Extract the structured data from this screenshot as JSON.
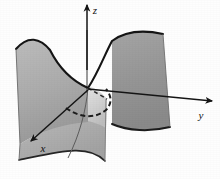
{
  "figure": {
    "kind": "3d-surface-plot",
    "title": "",
    "background_color": "#fefefe",
    "surface_name": "hyperbolic paraboloid saddle surface",
    "ink_color": "#151515"
  },
  "axes": {
    "origin": {
      "x": 87,
      "y": 88
    },
    "z": {
      "label": "z",
      "label_x": 95,
      "label_y": 12,
      "tip_x": 87,
      "tip_y": 5,
      "tail_x": 87,
      "tail_y": 93,
      "direction": "up"
    },
    "y": {
      "label": "y",
      "label_x": 201,
      "label_y": 117,
      "tip_x": 212,
      "tip_y": 101,
      "tail_x": 88,
      "tail_y": 89,
      "direction": "right-down"
    },
    "x": {
      "label": "x",
      "label_x": 43,
      "label_y": 150,
      "tip_x": 31,
      "tip_y": 141,
      "tail_x": 88,
      "tail_y": 90,
      "direction": "down-left"
    }
  },
  "surface": {
    "lobes": [
      {
        "name": "left-back-lobe",
        "fill_top": "#b3b3b3",
        "fill_bottom": "#9b9b9b",
        "path": "M 16 49 L 20 144 C 40 131 62 126 88 124 L 88 88 C 70 80 58 66 50 50 C 40 38 28 35 16 49 Z"
      },
      {
        "name": "right-back-lobe",
        "fill_top": "#9d9d9d",
        "fill_bottom": "#8a8a8a",
        "path": "M 112 41 C 124 32 140 29 163 34 L 170 127 C 150 132 128 131 112 124 Z"
      },
      {
        "name": "front-lower-lobe",
        "fill_top": "#c3c3c3",
        "fill_bottom": "#a5a5a5",
        "path": "M 88 88 L 106 99 L 105 161 C 88 143 58 152 19 160 L 20 144 C 42 130 64 124 88 122 Z"
      },
      {
        "name": "saddle-highlight-patch",
        "fill_top": "#dedede",
        "fill_bottom": "#c0c0c0",
        "path": "M 88 86 C 96 88 102 93 107 99 L 106 128 C 99 124 93 122 88 121 Z"
      }
    ],
    "edges": [
      {
        "name": "left-lobe-top-rim",
        "path": "M 16 49 C 28 35 40 38 50 50 C 58 66 70 80 88 88",
        "width": 1.9,
        "style": "solid"
      },
      {
        "name": "right-lobe-top-rim",
        "path": "M 88 88 C 98 73 104 56 112 41 C 124 32 140 29 163 34",
        "width": 1.9,
        "style": "solid"
      },
      {
        "name": "right-lobe-bottom-rim",
        "path": "M 112 124 C 128 131 150 132 170 127",
        "width": 1.9,
        "style": "solid"
      },
      {
        "name": "front-lobe-bottom-rim",
        "path": "M 19 160 C 58 152 88 143 105 161",
        "width": 1.7,
        "style": "solid"
      },
      {
        "name": "front-lobe-left-rim",
        "path": "M 16 49 L 20 144 L 19 160",
        "width": 0.9,
        "style": "solid"
      },
      {
        "name": "right-lobe-right-rim",
        "path": "M 163 34 L 170 127",
        "width": 0.9,
        "style": "solid"
      },
      {
        "name": "front-lobe-right-rim",
        "path": "M 106 99 L 105 161",
        "width": 0.9,
        "style": "solid"
      },
      {
        "name": "surface-ridge-through-origin",
        "path": "M 88 88 C 86 110 80 134 68 158",
        "width": 0.9,
        "style": "solid"
      },
      {
        "name": "hidden-trace-behind-surface",
        "path": "M 66 108 C 80 118 95 119 106 110 C 112 104 112 96 106 89",
        "width": 1.9,
        "style": "dashed",
        "dash": "5,3"
      },
      {
        "name": "hidden-trace-upper-arc",
        "path": "M 88 88 C 95 92 102 96 107 99",
        "width": 1.6,
        "style": "dashed",
        "dash": "4,3"
      }
    ]
  }
}
